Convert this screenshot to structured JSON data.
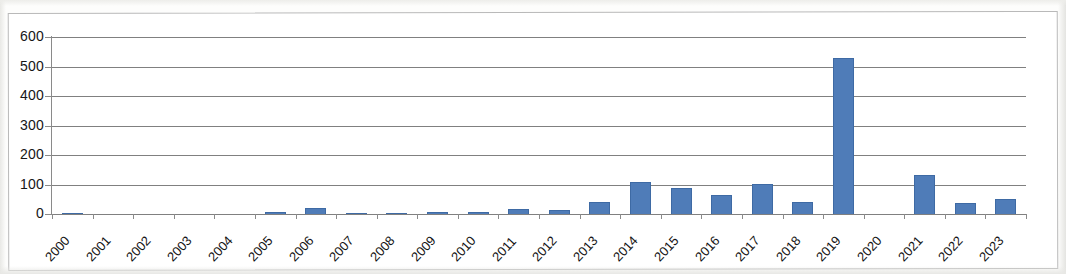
{
  "chart_data": {
    "type": "bar",
    "title": "",
    "subtitle": "",
    "xlabel": "",
    "ylabel": "",
    "categories": [
      "2000",
      "2001",
      "2002",
      "2003",
      "2004",
      "2005",
      "2006",
      "2007",
      "2008",
      "2009",
      "2010",
      "2011",
      "2012",
      "2013",
      "2014",
      "2015",
      "2016",
      "2017",
      "2018",
      "2019",
      "2020",
      "2021",
      "2022",
      "2023"
    ],
    "values": [
      5,
      0,
      0,
      0,
      0,
      7,
      20,
      5,
      5,
      6,
      6,
      16,
      15,
      40,
      108,
      88,
      65,
      103,
      42,
      530,
      0,
      132,
      38,
      50
    ],
    "series": [
      {
        "name": "",
        "values": [
          5,
          0,
          0,
          0,
          0,
          7,
          20,
          5,
          5,
          6,
          6,
          16,
          15,
          40,
          108,
          88,
          65,
          103,
          42,
          530,
          0,
          132,
          38,
          50
        ]
      }
    ],
    "ylim": [
      0,
      600
    ],
    "ytick_values": [
      0,
      100,
      200,
      300,
      400,
      500,
      600
    ],
    "ytick_labels": [
      "0",
      "100",
      "200",
      "300",
      "400",
      "500",
      "600"
    ],
    "grid": "horizontal",
    "legend": "none",
    "bar_color": "#4f7cb8",
    "bar_border_color": "#3e6aa4",
    "gridline_color": "#808080",
    "axis_color": "#8a8a8a",
    "frame_color": "#b9b9b9",
    "background_color": "#ffffff",
    "annotations": []
  }
}
